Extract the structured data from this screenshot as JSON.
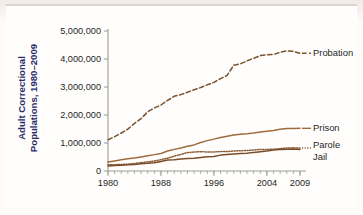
{
  "chart_data": {
    "type": "line",
    "title": "",
    "xlabel": "",
    "ylabel": "Adult Correctional Populations, 1980–2009",
    "ylabel_line1": "Adult Correctional",
    "ylabel_line2": "Populations, 1980–2009",
    "xlim": [
      1980,
      2009
    ],
    "ylim": [
      0,
      5000000
    ],
    "grid": false,
    "legend_position": "right-of-line-ends",
    "y_ticks": [
      0,
      1000000,
      2000000,
      3000000,
      4000000,
      5000000
    ],
    "y_tick_labels": [
      "0",
      "1,000,000",
      "2,000,000",
      "3,000,000",
      "4,000,000",
      "5,000,000"
    ],
    "x_ticks": [
      1980,
      1988,
      1996,
      2004,
      2009
    ],
    "x_tick_labels": [
      "1980",
      "1988",
      "1996",
      "2004",
      "2009"
    ],
    "x_minor_tick_interval": 1,
    "x": [
      1980,
      1981,
      1982,
      1983,
      1984,
      1985,
      1986,
      1987,
      1988,
      1989,
      1990,
      1991,
      1992,
      1993,
      1994,
      1995,
      1996,
      1997,
      1998,
      1999,
      2000,
      2001,
      2002,
      2003,
      2004,
      2005,
      2006,
      2007,
      2008,
      2009
    ],
    "series": [
      {
        "name": "Probation",
        "label": "Probation",
        "style": "dashed",
        "color": "#7a5230",
        "values": [
          1118000,
          1225000,
          1357000,
          1495000,
          1700000,
          1870000,
          2115000,
          2250000,
          2356000,
          2522000,
          2670000,
          2729000,
          2812000,
          2903000,
          2981000,
          3078000,
          3165000,
          3297000,
          3417000,
          3780000,
          3827000,
          3932000,
          4025000,
          4121000,
          4151000,
          4163000,
          4237000,
          4293000,
          4271000,
          4203000
        ]
      },
      {
        "name": "Prison",
        "label": "Prison",
        "style": "solid",
        "color": "#a06b3c",
        "values": [
          320000,
          360000,
          402000,
          437000,
          464000,
          503000,
          544000,
          585000,
          627000,
          712000,
          773000,
          825000,
          883000,
          932000,
          1016000,
          1085000,
          1138000,
          1197000,
          1245000,
          1287000,
          1316000,
          1330000,
          1355000,
          1390000,
          1421000,
          1448000,
          1492000,
          1518000,
          1519000,
          1524000
        ]
      },
      {
        "name": "Parole",
        "label": "Parole",
        "style": "dotted",
        "color": "#8a5a33",
        "values": [
          220000,
          225000,
          235000,
          246000,
          266000,
          300000,
          326000,
          355000,
          407000,
          456000,
          531000,
          590000,
          658000,
          676000,
          690000,
          679000,
          679000,
          694000,
          696000,
          714000,
          724000,
          732000,
          750000,
          769000,
          771000,
          780000,
          799000,
          821000,
          828000,
          819000
        ]
      },
      {
        "name": "Jail",
        "label": "Jail",
        "style": "solid",
        "color": "#7a4b28",
        "values": [
          182000,
          196000,
          209000,
          224000,
          234000,
          256000,
          274000,
          295000,
          343000,
          395000,
          405000,
          426000,
          445000,
          459000,
          486000,
          507000,
          518000,
          567000,
          592000,
          605000,
          621000,
          631000,
          665000,
          691000,
          714000,
          747000,
          766000,
          780000,
          785000,
          767000
        ]
      }
    ]
  },
  "axis": {
    "y_title_line1": "Adult Correctional",
    "y_title_line2": "Populations, 1980–2009"
  },
  "colors": {
    "probation": "#7a5230",
    "prison": "#a06b3c",
    "parole": "#8a5a33",
    "jail": "#7a4b28",
    "axis": "#9a9a9a",
    "axis_title": "#2b2b6b",
    "background": "#fffefc"
  }
}
